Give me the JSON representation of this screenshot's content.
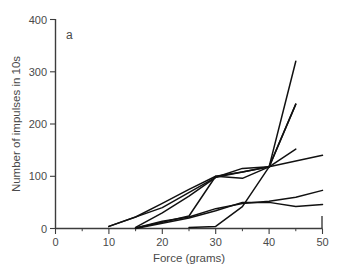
{
  "figure": {
    "panel_label": "a",
    "background_color": "#ffffff",
    "line_color": "#111111",
    "axis_color": "#3c3c3c",
    "text_color": "#4a4a4a"
  },
  "chart_data": {
    "type": "line",
    "title": "",
    "subtitle": "",
    "panel": "a",
    "xlabel": "Force (grams)",
    "ylabel": "Number of impulses in 10s",
    "xlim": [
      0,
      50
    ],
    "ylim": [
      0,
      400
    ],
    "xticks": [
      0,
      10,
      20,
      30,
      40,
      50
    ],
    "yticks": [
      0,
      100,
      200,
      300,
      400
    ],
    "xtick_labels": [
      "0",
      "10",
      "20",
      "30",
      "40",
      "50"
    ],
    "ytick_labels": [
      "0",
      "100",
      "200",
      "300",
      "400"
    ],
    "x_minor_ticks": [
      5,
      15,
      25,
      35,
      45
    ],
    "grid": false,
    "legend": false,
    "legend_position": "none",
    "annotations": [
      {
        "text": "a",
        "x": 3.5,
        "y": 378
      }
    ],
    "series": [
      {
        "name": "unit-1",
        "x": [
          10,
          15,
          20,
          25,
          30,
          35,
          40,
          45
        ],
        "values": [
          4,
          22,
          48,
          75,
          100,
          108,
          118,
          320
        ]
      },
      {
        "name": "unit-2",
        "x": [
          15,
          20,
          25,
          30,
          35,
          40,
          45
        ],
        "values": [
          2,
          30,
          62,
          98,
          115,
          118,
          238
        ]
      },
      {
        "name": "unit-3",
        "x": [
          15,
          20,
          25,
          30,
          35,
          40,
          45
        ],
        "values": [
          1,
          12,
          24,
          100,
          96,
          118,
          152
        ]
      },
      {
        "name": "unit-4",
        "x": [
          10,
          20,
          30,
          40,
          50
        ],
        "values": [
          4,
          40,
          98,
          118,
          140
        ]
      },
      {
        "name": "unit-5",
        "x": [
          15,
          20,
          25,
          30,
          35,
          40,
          45,
          50
        ],
        "values": [
          1,
          14,
          22,
          38,
          48,
          52,
          60,
          73
        ]
      },
      {
        "name": "unit-6",
        "x": [
          15,
          20,
          25,
          30,
          35,
          40,
          45,
          50
        ],
        "values": [
          0,
          10,
          20,
          34,
          50,
          50,
          42,
          46
        ]
      },
      {
        "name": "unit-7",
        "x": [
          25,
          30,
          35,
          40,
          45
        ],
        "values": [
          2,
          4,
          42,
          118,
          238
        ]
      }
    ]
  },
  "axes": {
    "x_title": "Force (grams)",
    "y_title": "Number of impulses in 10s"
  }
}
